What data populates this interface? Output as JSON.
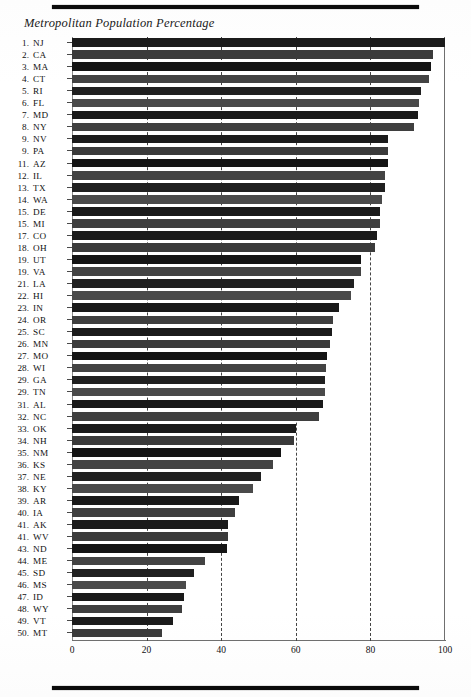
{
  "page": {
    "top_rule": "horizontal-rule",
    "bottom_rule": "horizontal-rule"
  },
  "chart_data": {
    "type": "bar",
    "orientation": "horizontal",
    "title": "Metropolitan Population Percentage",
    "xlabel": "",
    "ylabel": "",
    "xlim": [
      0,
      100
    ],
    "xticks": [
      0,
      20,
      40,
      60,
      80,
      100
    ],
    "grid": "vertical dashed gridlines at 20, 40, 60, 80",
    "legend": "none",
    "categories": [
      "NJ",
      "CA",
      "MA",
      "CT",
      "RI",
      "FL",
      "MD",
      "NY",
      "NV",
      "PA",
      "AZ",
      "IL",
      "TX",
      "WA",
      "DE",
      "MI",
      "CO",
      "OH",
      "UT",
      "VA",
      "LA",
      "HI",
      "IN",
      "OR",
      "SC",
      "MN",
      "MO",
      "WI",
      "GA",
      "TN",
      "AL",
      "NC",
      "OK",
      "NH",
      "NM",
      "KS",
      "NE",
      "KY",
      "AR",
      "IA",
      "AK",
      "WV",
      "ND",
      "ME",
      "SD",
      "MS",
      "ID",
      "WY",
      "VT",
      "MT"
    ],
    "ranks": [
      "1.",
      "2.",
      "3.",
      "4.",
      "5.",
      "6.",
      "7.",
      "8.",
      "9.",
      "9.",
      "11.",
      "12.",
      "13.",
      "14.",
      "15.",
      "15.",
      "17.",
      "18.",
      "19.",
      "19.",
      "21.",
      "22.",
      "23.",
      "24.",
      "25.",
      "26.",
      "27.",
      "28.",
      "29.",
      "29.",
      "31.",
      "32.",
      "33.",
      "34.",
      "35.",
      "36.",
      "37.",
      "38.",
      "39.",
      "40.",
      "41.",
      "41.",
      "43.",
      "44.",
      "45.",
      "46.",
      "47.",
      "48.",
      "49.",
      "50."
    ],
    "values": [
      100.0,
      96.7,
      96.2,
      95.7,
      93.6,
      93.0,
      92.8,
      91.7,
      84.8,
      84.8,
      84.7,
      84.0,
      83.9,
      83.0,
      82.7,
      82.7,
      81.8,
      81.3,
      77.5,
      77.5,
      75.5,
      74.7,
      71.6,
      70.0,
      69.8,
      69.3,
      68.3,
      68.1,
      67.7,
      67.7,
      67.4,
      66.3,
      60.1,
      59.4,
      56.0,
      53.8,
      50.6,
      48.5,
      44.7,
      43.8,
      41.8,
      41.8,
      41.6,
      35.7,
      32.6,
      30.6,
      30.0,
      29.6,
      27.0,
      24.0
    ]
  }
}
